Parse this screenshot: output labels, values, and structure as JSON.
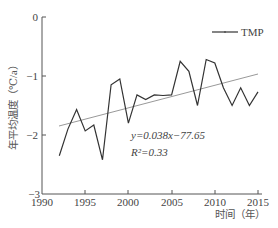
{
  "chart_data": {
    "type": "line",
    "title": "",
    "xlabel": "时间（年）",
    "ylabel": "年平均温度（℃/a）",
    "xlim": [
      1990,
      2015
    ],
    "ylim": [
      -3,
      0
    ],
    "xticks": [
      1990,
      1995,
      2000,
      2005,
      2010,
      2015
    ],
    "yticks": [
      0,
      -1,
      -2,
      -3
    ],
    "grid": false,
    "legend_position": "upper-right",
    "x": [
      1992,
      1993,
      1994,
      1995,
      1996,
      1997,
      1998,
      1999,
      2000,
      2001,
      2002,
      2003,
      2004,
      2005,
      2006,
      2007,
      2008,
      2009,
      2010,
      2011,
      2012,
      2013,
      2014,
      2015
    ],
    "series": [
      {
        "name": "TMP",
        "color": "#333333",
        "values": [
          -2.35,
          -1.9,
          -1.57,
          -1.93,
          -1.83,
          -2.42,
          -1.15,
          -1.05,
          -1.8,
          -1.32,
          -1.4,
          -1.32,
          -1.33,
          -1.32,
          -0.75,
          -0.92,
          -1.5,
          -0.72,
          -0.78,
          -1.2,
          -1.5,
          -1.2,
          -1.5,
          -1.27
        ]
      },
      {
        "name": "trend",
        "color": "#999999",
        "values": [
          -1.85,
          -0.97
        ],
        "x": [
          1992,
          2015
        ]
      }
    ],
    "annotations": [
      "y=0.038x−77.65",
      "R²=0.33"
    ]
  },
  "legend": {
    "label": "TMP"
  },
  "axes": {
    "xlabel": "时间（年）",
    "ylabel": "年平均温度（℃/a）",
    "xticks": [
      "1990",
      "1995",
      "2000",
      "2005",
      "2010",
      "2015"
    ],
    "yticks": [
      "0",
      "−1",
      "−2",
      "−3"
    ]
  },
  "annotation": {
    "eq": "y=0.038x−77.65",
    "r2": "R²=0.33"
  }
}
